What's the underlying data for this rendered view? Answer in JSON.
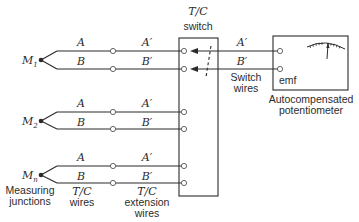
{
  "diagram": {
    "type": "thermocouple multiplexing circuit",
    "switch": {
      "title_line1": "T/C",
      "title_line2": "switch"
    },
    "junctions": [
      {
        "label": "M",
        "sub": "1",
        "wire_a": "A",
        "wire_b": "B",
        "ext_a": "A′",
        "ext_b": "B′"
      },
      {
        "label": "M",
        "sub": "2",
        "wire_a": "A",
        "wire_b": "B",
        "ext_a": "A′",
        "ext_b": "B′"
      },
      {
        "label": "M",
        "sub": "n",
        "wire_a": "A",
        "wire_b": "B",
        "ext_a": "A′",
        "ext_b": "B′"
      }
    ],
    "switch_wires": {
      "a": "A′",
      "b": "B′",
      "label_line1": "Switch",
      "label_line2": "wires"
    },
    "potentiometer": {
      "emf_label": "emf",
      "caption_line1": "Autocompensated",
      "caption_line2": "potentiometer"
    },
    "bottom_labels": {
      "measuring_line1": "Measuring",
      "measuring_line2": "junctions",
      "tc_wires_line1": "T/C",
      "tc_wires_line2": "wires",
      "ext_wires_line1": "T/C",
      "ext_wires_line2": "extension",
      "ext_wires_line3": "wires"
    },
    "colors": {
      "line": "#2b2b2b",
      "background": "#ffffff"
    }
  }
}
